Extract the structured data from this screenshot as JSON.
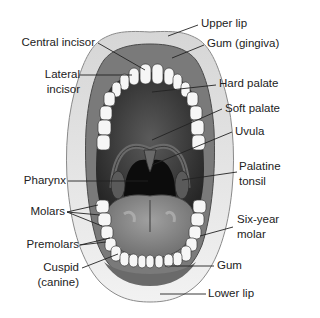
{
  "colors": {
    "background": "#ffffff",
    "lip": "#e4e4e4",
    "lip_edge": "#8a8a8a",
    "gum": "#7a7a7a",
    "palate": "#3a3a3a",
    "throat": "#0c0c0c",
    "tongue": "#8c8c8c",
    "teeth": "#f6f6f6",
    "leader_line": "#222222",
    "text": "#222222"
  },
  "labels": {
    "upper_lip": "Upper lip",
    "gum_gingiva": "Gum (gingiva)",
    "central_incisor": "Central incisor",
    "lateral_incisor_1": "Lateral",
    "lateral_incisor_2": "incisor",
    "hard_palate": "Hard palate",
    "soft_palate": "Soft palate",
    "uvula": "Uvula",
    "pharynx": "Pharynx",
    "palatine_tonsil_1": "Palatine",
    "palatine_tonsil_2": "tonsil",
    "molars": "Molars",
    "six_year_molar_1": "Six-year",
    "six_year_molar_2": "molar",
    "premolars": "Premolars",
    "cuspid_1": "Cuspid",
    "cuspid_2": "(canine)",
    "gum": "Gum",
    "lower_lip": "Lower lip"
  }
}
